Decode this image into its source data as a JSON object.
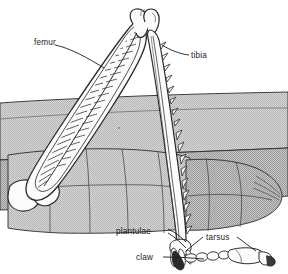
{
  "figure": {
    "background_color": "#ffffff",
    "ink_color": "#1a1a1a",
    "body_fill_color": "#b9b9b9",
    "body_fill_light_color": "#cfcfcf",
    "limb_fill_color": "#fbfbfb"
  },
  "labels": {
    "femur": "femur",
    "tibia": "tibia",
    "plantulae": "plantulae",
    "tarsus": "tarsus",
    "claw": "claw"
  },
  "parts": [
    {
      "id": "femur",
      "label": "femur",
      "description": "enlarged femur with pennate muscle striations"
    },
    {
      "id": "tibia",
      "label": "tibia",
      "description": "long spined tibia"
    },
    {
      "id": "plantulae",
      "label": "plantulae",
      "description": "pads beneath tarsal segments"
    },
    {
      "id": "tarsus",
      "label": "tarsus",
      "description": "segmented tarsus"
    },
    {
      "id": "claw",
      "label": "claw",
      "description": "terminal claw"
    }
  ]
}
